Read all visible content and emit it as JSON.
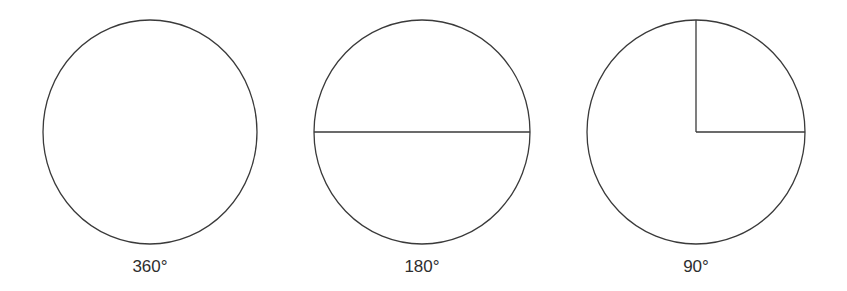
{
  "diagram": {
    "type": "angle-circles",
    "stroke_color": "#3a3a3a",
    "background": "#ffffff",
    "figures": [
      {
        "label": "360°",
        "angle_degrees": 360,
        "center": [
          150,
          132
        ],
        "radius_x": 107,
        "radius_y": 112,
        "dividing_lines": []
      },
      {
        "label": "180°",
        "angle_degrees": 180,
        "center": [
          422,
          132
        ],
        "radius_x": 108,
        "radius_y": 112,
        "dividing_lines": [
          "horizontal-diameter"
        ]
      },
      {
        "label": "90°",
        "angle_degrees": 90,
        "center": [
          696,
          132
        ],
        "radius_x": 109,
        "radius_y": 112,
        "dividing_lines": [
          "radius-up",
          "radius-right"
        ]
      }
    ]
  }
}
